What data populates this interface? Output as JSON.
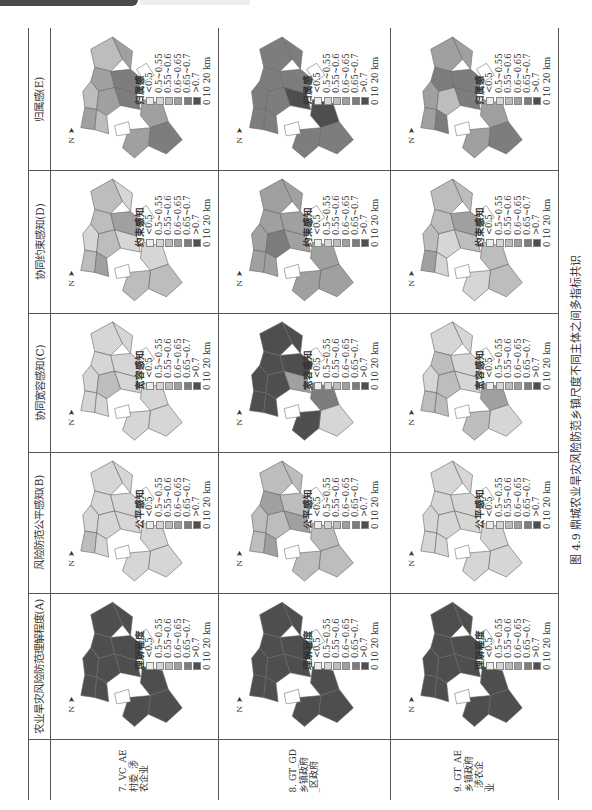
{
  "page_header": {
    "tag_text": "",
    "sub_text": ""
  },
  "figure": {
    "caption": "图 4.9   鼎城农业旱灾风险防范乡镇尺度不同主体之间多指标共识"
  },
  "colors": {
    "lt05": "#ececec",
    "c05_055": "#d6d6d6",
    "c055_06": "#bdbdbd",
    "c06_065": "#a0a0a0",
    "c065_07": "#7d7d7d",
    "gt07": "#4e4e4e",
    "outline": "#ffffff"
  },
  "table": {
    "indicators": [
      {
        "id": "E",
        "header": "归属感(E)",
        "legend_title": "归属感"
      },
      {
        "id": "D",
        "header": "协同约束感知(D)",
        "legend_title": "约束感知"
      },
      {
        "id": "C",
        "header": "协同宽容感知(C)",
        "legend_title": "宽容感知"
      },
      {
        "id": "B",
        "header": "风险防范公平感知(B)",
        "legend_title": "公平感知"
      },
      {
        "id": "A",
        "header": "农业旱灾风险防范理解程度(A)",
        "legend_title": "理解程度"
      }
    ],
    "groups": [
      {
        "id": "7",
        "label_lines": [
          "7. VC_AE",
          "村委_涉",
          "农企业"
        ]
      },
      {
        "id": "8",
        "label_lines": [
          "8. GT_GD",
          "乡镇政府",
          "_区政府"
        ]
      },
      {
        "id": "9",
        "label_lines": [
          "9. GT_AE",
          "乡镇政府",
          "_涉农企",
          "业"
        ]
      }
    ],
    "legend_classes": [
      "<0.5",
      "0.5~0.55",
      "0.55~0.6",
      "0.6~0.65",
      "0.65~0.7",
      ">0.7"
    ],
    "scale_bar": "0   10   20 km",
    "north_label": "N"
  },
  "maps": {
    "E": {
      "7": [
        2,
        3,
        3,
        4,
        2,
        3,
        4,
        3,
        2,
        3,
        4,
        3
      ],
      "8": [
        4,
        4,
        4,
        4,
        4,
        4,
        5,
        4,
        4,
        5,
        4,
        4
      ],
      "9": [
        3,
        3,
        4,
        4,
        3,
        2,
        4,
        3,
        4,
        3,
        4,
        3
      ]
    },
    "D": {
      "7": [
        2,
        1,
        2,
        3,
        1,
        2,
        1,
        2,
        3,
        1,
        2,
        2
      ],
      "8": [
        3,
        3,
        3,
        3,
        3,
        4,
        3,
        3,
        3,
        3,
        3,
        3
      ],
      "9": [
        2,
        2,
        2,
        3,
        2,
        1,
        2,
        3,
        1,
        2,
        2,
        1
      ]
    },
    "C": {
      "7": [
        1,
        1,
        1,
        1,
        1,
        2,
        1,
        1,
        1,
        1,
        1,
        1
      ],
      "8": [
        5,
        5,
        5,
        5,
        5,
        5,
        3,
        5,
        5,
        4,
        1,
        5
      ],
      "9": [
        1,
        1,
        2,
        1,
        1,
        2,
        1,
        2,
        2,
        3,
        1,
        2
      ]
    },
    "B": {
      "7": [
        1,
        1,
        1,
        1,
        1,
        1,
        1,
        2,
        1,
        1,
        1,
        1
      ],
      "8": [
        2,
        2,
        3,
        2,
        2,
        2,
        3,
        2,
        3,
        2,
        2,
        2
      ],
      "9": [
        1,
        1,
        1,
        1,
        1,
        1,
        1,
        1,
        1,
        1,
        1,
        1
      ]
    },
    "A": {
      "7": [
        5,
        5,
        5,
        5,
        5,
        5,
        5,
        5,
        5,
        5,
        5,
        5
      ],
      "8": [
        5,
        5,
        5,
        5,
        5,
        5,
        5,
        5,
        5,
        5,
        5,
        5
      ],
      "9": [
        5,
        5,
        5,
        5,
        5,
        5,
        5,
        5,
        5,
        5,
        5,
        5
      ]
    }
  }
}
